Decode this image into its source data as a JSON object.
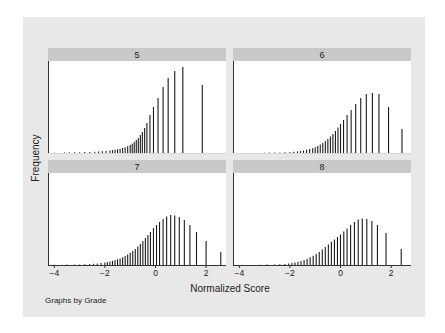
{
  "chart_data": {
    "type": "bar",
    "subtype": "spike histogram (small multiples)",
    "title": "",
    "xlabel": "Normalized Score",
    "ylabel": "Frequency",
    "note": "Graphs by Grade",
    "x_ticks": [
      -4,
      -2,
      0,
      2
    ],
    "xlim": [
      -4.1,
      2.7
    ],
    "y_ticks": [],
    "grid": false,
    "legend": null,
    "panels": [
      {
        "label": "5",
        "spikes": [
          [
            -4.0,
            0.3
          ],
          [
            -3.6,
            0.5
          ],
          [
            -3.4,
            0.6
          ],
          [
            -3.2,
            0.7
          ],
          [
            -3.0,
            0.8
          ],
          [
            -2.8,
            1.0
          ],
          [
            -2.6,
            1.1
          ],
          [
            -2.4,
            1.3
          ],
          [
            -2.25,
            1.5
          ],
          [
            -2.1,
            1.8
          ],
          [
            -1.95,
            2.1
          ],
          [
            -1.8,
            2.5
          ],
          [
            -1.7,
            2.9
          ],
          [
            -1.6,
            3.3
          ],
          [
            -1.5,
            3.8
          ],
          [
            -1.4,
            4.3
          ],
          [
            -1.3,
            5.0
          ],
          [
            -1.2,
            5.8
          ],
          [
            -1.1,
            6.8
          ],
          [
            -1.0,
            8.0
          ],
          [
            -0.92,
            9.3
          ],
          [
            -0.84,
            11
          ],
          [
            -0.76,
            13
          ],
          [
            -0.68,
            15
          ],
          [
            -0.6,
            18
          ],
          [
            -0.52,
            21
          ],
          [
            -0.43,
            25
          ],
          [
            -0.34,
            30
          ],
          [
            -0.22,
            38
          ],
          [
            -0.08,
            46
          ],
          [
            0.1,
            55
          ],
          [
            0.3,
            66
          ],
          [
            0.5,
            75
          ],
          [
            0.76,
            82
          ],
          [
            1.08,
            86
          ],
          [
            1.85,
            68
          ]
        ]
      },
      {
        "label": "6",
        "spikes": [
          [
            -3.0,
            0.3
          ],
          [
            -2.8,
            0.4
          ],
          [
            -2.6,
            0.5
          ],
          [
            -2.4,
            0.6
          ],
          [
            -2.2,
            0.8
          ],
          [
            -2.0,
            1.0
          ],
          [
            -1.85,
            1.3
          ],
          [
            -1.7,
            1.7
          ],
          [
            -1.58,
            2.1
          ],
          [
            -1.46,
            2.6
          ],
          [
            -1.34,
            3.2
          ],
          [
            -1.22,
            3.9
          ],
          [
            -1.1,
            4.8
          ],
          [
            -1.0,
            5.8
          ],
          [
            -0.9,
            7.0
          ],
          [
            -0.8,
            8.5
          ],
          [
            -0.7,
            10
          ],
          [
            -0.6,
            12
          ],
          [
            -0.5,
            14
          ],
          [
            -0.4,
            16.5
          ],
          [
            -0.3,
            19
          ],
          [
            -0.2,
            22
          ],
          [
            -0.1,
            25.5
          ],
          [
            0.0,
            29
          ],
          [
            0.12,
            33
          ],
          [
            0.26,
            38
          ],
          [
            0.42,
            43
          ],
          [
            0.6,
            49
          ],
          [
            0.8,
            55
          ],
          [
            1.02,
            59
          ],
          [
            1.26,
            60
          ],
          [
            1.52,
            59
          ],
          [
            1.9,
            46
          ],
          [
            2.43,
            24
          ]
        ]
      },
      {
        "label": "7",
        "spikes": [
          [
            -4.0,
            0.3
          ],
          [
            -3.5,
            0.4
          ],
          [
            -3.2,
            0.5
          ],
          [
            -3.0,
            0.6
          ],
          [
            -2.8,
            0.8
          ],
          [
            -2.6,
            1.0
          ],
          [
            -2.45,
            1.3
          ],
          [
            -2.3,
            1.6
          ],
          [
            -2.15,
            2.0
          ],
          [
            -2.0,
            2.5
          ],
          [
            -1.9,
            3.0
          ],
          [
            -1.8,
            3.6
          ],
          [
            -1.7,
            4.2
          ],
          [
            -1.6,
            4.9
          ],
          [
            -1.5,
            5.7
          ],
          [
            -1.4,
            6.6
          ],
          [
            -1.3,
            7.7
          ],
          [
            -1.2,
            9.0
          ],
          [
            -1.1,
            10.5
          ],
          [
            -1.0,
            12.2
          ],
          [
            -0.9,
            14
          ],
          [
            -0.8,
            16
          ],
          [
            -0.7,
            18.5
          ],
          [
            -0.6,
            21
          ],
          [
            -0.5,
            24
          ],
          [
            -0.4,
            27
          ],
          [
            -0.3,
            30
          ],
          [
            -0.2,
            33
          ],
          [
            -0.08,
            37
          ],
          [
            0.04,
            40
          ],
          [
            0.16,
            43
          ],
          [
            0.3,
            46
          ],
          [
            0.44,
            48.5
          ],
          [
            0.6,
            50
          ],
          [
            0.76,
            49.5
          ],
          [
            0.94,
            48
          ],
          [
            1.14,
            45
          ],
          [
            1.36,
            40
          ],
          [
            1.62,
            33
          ],
          [
            2.0,
            24
          ],
          [
            2.58,
            13
          ]
        ]
      },
      {
        "label": "8",
        "spikes": [
          [
            -3.2,
            0.3
          ],
          [
            -2.9,
            0.4
          ],
          [
            -2.6,
            0.6
          ],
          [
            -2.4,
            0.8
          ],
          [
            -2.2,
            1.1
          ],
          [
            -2.05,
            1.5
          ],
          [
            -1.92,
            2.0
          ],
          [
            -1.8,
            2.6
          ],
          [
            -1.68,
            3.3
          ],
          [
            -1.56,
            4.1
          ],
          [
            -1.44,
            5.1
          ],
          [
            -1.32,
            6.3
          ],
          [
            -1.2,
            7.7
          ],
          [
            -1.08,
            9.3
          ],
          [
            -0.96,
            11
          ],
          [
            -0.84,
            13
          ],
          [
            -0.72,
            15.5
          ],
          [
            -0.6,
            18
          ],
          [
            -0.48,
            20.5
          ],
          [
            -0.36,
            23
          ],
          [
            -0.24,
            25.5
          ],
          [
            -0.12,
            28
          ],
          [
            0.0,
            30.5
          ],
          [
            0.13,
            33.5
          ],
          [
            0.26,
            36.5
          ],
          [
            0.4,
            40
          ],
          [
            0.55,
            43
          ],
          [
            0.7,
            45.5
          ],
          [
            0.86,
            46.5
          ],
          [
            1.04,
            46
          ],
          [
            1.24,
            44
          ],
          [
            1.46,
            40
          ],
          [
            1.8,
            32
          ],
          [
            2.4,
            16
          ]
        ]
      }
    ]
  }
}
